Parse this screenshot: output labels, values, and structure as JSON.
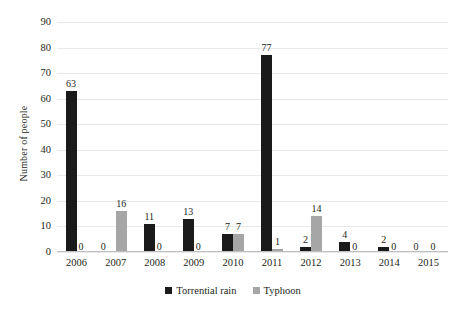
{
  "chart_data": {
    "type": "bar",
    "title": "",
    "xlabel": "",
    "ylabel": "Number of people",
    "ylim": [
      0,
      90
    ],
    "ytick_step": 10,
    "yticks": [
      0,
      10,
      20,
      30,
      40,
      50,
      60,
      70,
      80,
      90
    ],
    "grid": true,
    "legend_position": "bottom",
    "categories": [
      "2006",
      "2007",
      "2008",
      "2009",
      "2010",
      "2011",
      "2012",
      "2013",
      "2014",
      "2015"
    ],
    "series": [
      {
        "name": "Torrential rain",
        "color": "#1a1a1a",
        "values": [
          63,
          0,
          11,
          13,
          7,
          77,
          2,
          4,
          2,
          0
        ]
      },
      {
        "name": "Typhoon",
        "color": "#a6a6a6",
        "values": [
          0,
          16,
          0,
          0,
          7,
          1,
          14,
          0,
          0,
          0
        ]
      }
    ],
    "data_labels": [
      [
        "63",
        "0"
      ],
      [
        "0",
        "16"
      ],
      [
        "11",
        "0"
      ],
      [
        "13",
        "0"
      ],
      [
        "7",
        "7"
      ],
      [
        "77",
        "1"
      ],
      [
        "2",
        "14"
      ],
      [
        "4",
        "0"
      ],
      [
        "2",
        "0"
      ],
      [
        "0",
        "0"
      ]
    ]
  },
  "legend": {
    "items": [
      {
        "label": "Torrential rain",
        "swatch": "rain"
      },
      {
        "label": "Typhoon",
        "swatch": "typ"
      }
    ]
  }
}
